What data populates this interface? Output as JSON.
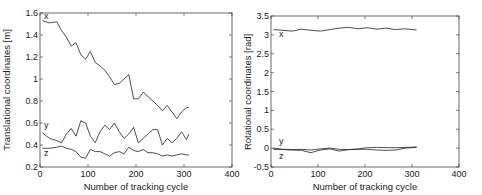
{
  "chart_data": [
    {
      "type": "line",
      "title": "",
      "xlabel": "Number of tracking cycle",
      "ylabel": "Translational coordinates [m]",
      "xlim": [
        0,
        400
      ],
      "ylim": [
        0.2,
        1.6
      ],
      "xticks": [
        "0",
        "100",
        "200",
        "300",
        "400"
      ],
      "yticks": [
        "0.2",
        "0.4",
        "0.6",
        "0.8",
        "1",
        "1.2",
        "1.4",
        "1.6"
      ],
      "grid": false,
      "legend": "inline labels",
      "x": [
        5,
        20,
        35,
        45,
        55,
        65,
        75,
        85,
        95,
        105,
        115,
        125,
        135,
        145,
        155,
        165,
        175,
        185,
        195,
        205,
        215,
        225,
        235,
        245,
        255,
        265,
        275,
        285,
        295,
        305,
        310
      ],
      "series": [
        {
          "name": "x",
          "values": [
            1.53,
            1.51,
            1.52,
            1.44,
            1.38,
            1.3,
            1.33,
            1.22,
            1.18,
            1.25,
            1.15,
            1.12,
            1.08,
            1.02,
            0.95,
            0.96,
            1.0,
            1.04,
            0.82,
            0.82,
            0.88,
            0.84,
            0.8,
            0.76,
            0.71,
            0.76,
            0.7,
            0.64,
            0.7,
            0.74,
            0.74
          ]
        },
        {
          "name": "y",
          "values": [
            0.51,
            0.46,
            0.44,
            0.42,
            0.5,
            0.55,
            0.48,
            0.62,
            0.6,
            0.48,
            0.42,
            0.52,
            0.58,
            0.54,
            0.6,
            0.52,
            0.46,
            0.5,
            0.56,
            0.42,
            0.46,
            0.5,
            0.54,
            0.54,
            0.4,
            0.46,
            0.42,
            0.46,
            0.52,
            0.45,
            0.5
          ]
        },
        {
          "name": "z",
          "values": [
            0.37,
            0.37,
            0.38,
            0.39,
            0.37,
            0.36,
            0.34,
            0.29,
            0.28,
            0.36,
            0.34,
            0.34,
            0.32,
            0.3,
            0.33,
            0.34,
            0.32,
            0.38,
            0.35,
            0.34,
            0.36,
            0.33,
            0.33,
            0.32,
            0.3,
            0.31,
            0.3,
            0.31,
            0.32,
            0.31,
            0.31
          ]
        }
      ]
    },
    {
      "type": "line",
      "title": "",
      "xlabel": "Number of tracking cycle",
      "ylabel": "Rotational coordinates [rad]",
      "xlim": [
        0,
        400
      ],
      "ylim": [
        -0.5,
        3.5
      ],
      "xticks": [
        "0",
        "100",
        "200",
        "300",
        "400"
      ],
      "yticks": [
        "-0.5",
        "0",
        "0.5",
        "1",
        "1.5",
        "2",
        "2.5",
        "3",
        "3.5"
      ],
      "grid": false,
      "legend": "inline labels",
      "x": [
        5,
        25,
        45,
        65,
        85,
        105,
        125,
        145,
        165,
        185,
        205,
        225,
        245,
        265,
        285,
        310
      ],
      "series": [
        {
          "name": "x",
          "values": [
            3.14,
            3.12,
            3.1,
            3.15,
            3.12,
            3.1,
            3.14,
            3.18,
            3.2,
            3.16,
            3.19,
            3.15,
            3.18,
            3.14,
            3.16,
            3.13
          ]
        },
        {
          "name": "y",
          "values": [
            0.0,
            -0.03,
            -0.04,
            -0.03,
            -0.05,
            -0.02,
            0.0,
            -0.03,
            -0.04,
            -0.02,
            0.01,
            0.02,
            0.01,
            0.01,
            0.02,
            0.03
          ]
        },
        {
          "name": "z",
          "values": [
            -0.03,
            -0.04,
            -0.05,
            -0.06,
            -0.12,
            -0.05,
            -0.02,
            -0.08,
            -0.04,
            -0.03,
            -0.03,
            -0.05,
            -0.06,
            -0.05,
            0.0,
            0.02
          ]
        }
      ]
    }
  ],
  "labels": {
    "left_xlabel": "Number of tracking cycle",
    "left_ylabel": "Translational coordinates [m]",
    "right_xlabel": "Number of tracking cycle",
    "right_ylabel": "Rotational coordinates [rad]",
    "series_x": "x",
    "series_y": "y",
    "series_z": "z"
  },
  "colors": {
    "line": "#222222",
    "axis": "#444444",
    "background": "#ffffff"
  }
}
